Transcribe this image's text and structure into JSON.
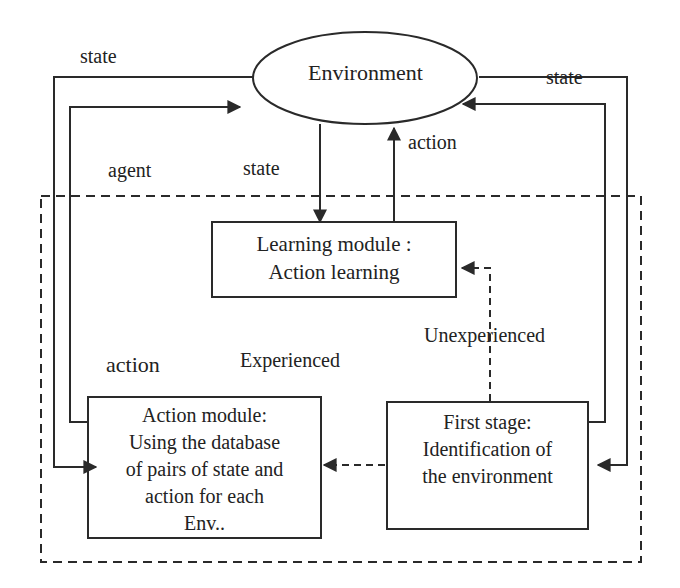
{
  "diagram": {
    "environment": {
      "label": "Environment"
    },
    "learning_module": {
      "lines": [
        "Learning module :",
        "Action learning"
      ]
    },
    "action_module": {
      "lines": [
        "Action module:",
        "Using the database",
        "of pairs of state and",
        "action for each",
        "Env.."
      ]
    },
    "first_stage": {
      "lines": [
        "First stage:",
        "Identification of",
        "the environment"
      ]
    },
    "labels": {
      "state_top_left": "state",
      "state_top_right": "state",
      "agent": "agent",
      "state_center": "state",
      "action_center": "action",
      "action_left": "action",
      "experienced": "Experienced",
      "unexperienced": "Unexperienced"
    },
    "colors": {
      "line": "#2a2a2a",
      "background": "#ffffff",
      "text": "#222222"
    }
  }
}
